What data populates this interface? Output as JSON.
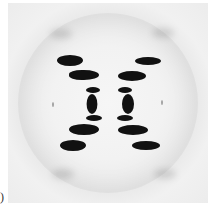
{
  "image": {
    "description": "X-ray fiber diffraction pattern with X-shaped arrangement of dark reflections on light gray background",
    "colors": {
      "background": "#f2f2f2",
      "spots": "#111111"
    },
    "panel_label": ")"
  },
  "spots": [
    {
      "name": "upper-left-outer",
      "x": 57,
      "y": 55,
      "w": 26,
      "h": 11
    },
    {
      "name": "upper-left-inner",
      "x": 68,
      "y": 69,
      "w": 30,
      "h": 10
    },
    {
      "name": "upper-right-outer",
      "x": 128,
      "y": 56,
      "w": 26,
      "h": 8
    },
    {
      "name": "upper-right-inner",
      "x": 112,
      "y": 70,
      "w": 28,
      "h": 10
    },
    {
      "name": "center-left",
      "x": 83,
      "y": 86,
      "w": 14,
      "h": 33
    },
    {
      "name": "center-right",
      "x": 113,
      "y": 86,
      "w": 14,
      "h": 33
    },
    {
      "name": "lower-left-inner",
      "x": 68,
      "y": 124,
      "w": 30,
      "h": 11
    },
    {
      "name": "lower-left-outer",
      "x": 57,
      "y": 139,
      "w": 26,
      "h": 11
    },
    {
      "name": "lower-right-inner",
      "x": 112,
      "y": 124,
      "w": 30,
      "h": 10
    },
    {
      "name": "lower-right-outer",
      "x": 128,
      "y": 140,
      "w": 28,
      "h": 9
    }
  ]
}
